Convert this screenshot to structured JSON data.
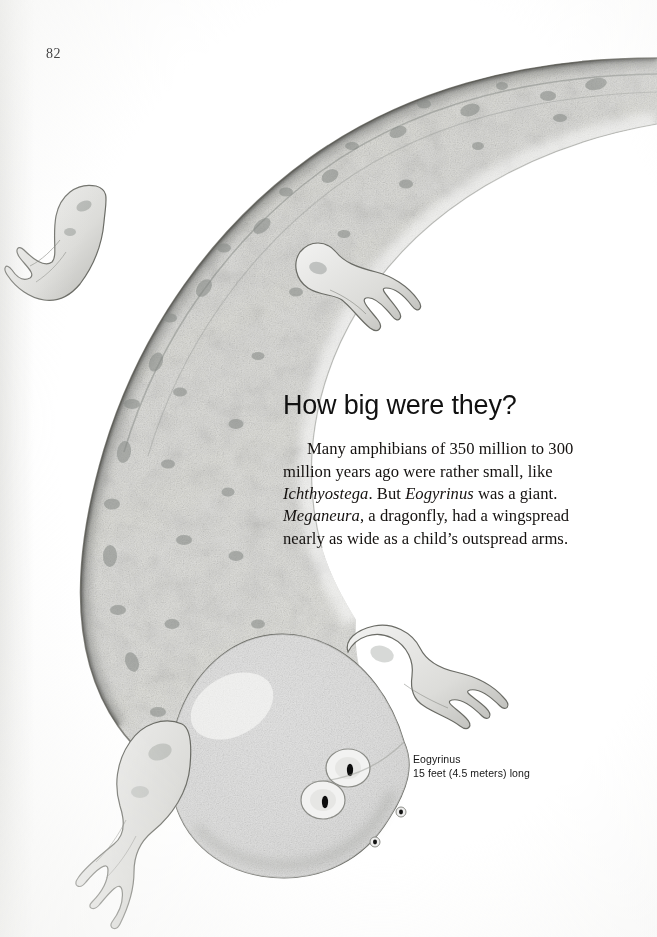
{
  "page": {
    "folio": "82",
    "background_color": "#ffffff"
  },
  "article": {
    "heading": "How big were they?",
    "paragraph_plain": "Many amphibians of 350 million to 300 million years ago were rather small, like Ichthyostega. But Eogyrinus was a giant. Meganeura, a dragonfly, had a wingspread nearly as wide as a child's outspread arms.",
    "paragraph_runs": [
      {
        "text": "Many amphibians of 350 million to 300 million years ago were rather small, like ",
        "style": "roman"
      },
      {
        "text": "Ichthyostega",
        "style": "italic"
      },
      {
        "text": ". But ",
        "style": "roman"
      },
      {
        "text": "Eogyrinus",
        "style": "italic"
      },
      {
        "text": " was a giant. ",
        "style": "roman"
      },
      {
        "text": "Meganeura",
        "style": "italic"
      },
      {
        "text": ", a dragonfly, had a wingspread nearly as wide as a child’s outspread arms.",
        "style": "roman"
      }
    ]
  },
  "figure": {
    "caption_name": "Eogyrinus",
    "caption_size": "15 feet (4.5 meters) long",
    "body_color": "#d2d2ce",
    "body_light": "#ececeb",
    "spot_color": "#8f9390",
    "outline_color": "#4a4a4a",
    "eye_color": "#0d0d0d"
  }
}
